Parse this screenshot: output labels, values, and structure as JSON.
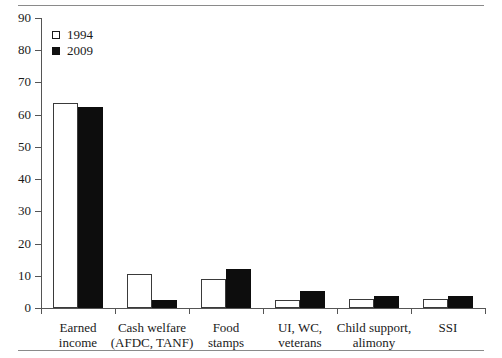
{
  "chart_data": {
    "type": "bar",
    "title": "",
    "subtitle": "",
    "xlabel": "",
    "ylabel": "",
    "ylim": [
      0,
      90
    ],
    "yticks": [
      0,
      10,
      20,
      30,
      40,
      50,
      60,
      70,
      80,
      90
    ],
    "grid": false,
    "legend_position": "top-left",
    "categories": [
      "Earned\nincome",
      "Cash welfare\n(AFDC, TANF)",
      "Food\nstamps",
      "UI, WC,\nveterans",
      "Child support,\nalimony",
      "SSI"
    ],
    "series": [
      {
        "name": "1994",
        "swatch": "open-square",
        "color": "#ffffff",
        "values": [
          63.5,
          10.5,
          9.0,
          2.5,
          2.8,
          2.8
        ]
      },
      {
        "name": "2009",
        "swatch": "filled-square",
        "color": "#0d0d0d",
        "values": [
          62.5,
          2.5,
          12.0,
          5.3,
          3.8,
          3.8
        ]
      }
    ]
  },
  "legend": {
    "items": [
      {
        "label": "1994"
      },
      {
        "label": "2009"
      }
    ]
  },
  "colors": {
    "series_1994": "#ffffff",
    "series_2009": "#0d0d0d",
    "axis": "#555555",
    "rule": "#8a8a8a",
    "text": "#1a1a1a"
  }
}
